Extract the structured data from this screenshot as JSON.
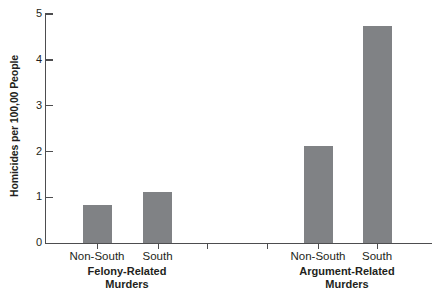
{
  "chart_data": {
    "type": "bar",
    "title": "",
    "xlabel": "",
    "ylabel": "Homicides per 100,00 People",
    "ylim": [
      0,
      5
    ],
    "yticks": [
      "0",
      "1",
      "2",
      "3",
      "4",
      "5"
    ],
    "grid": false,
    "legend": "none",
    "bar_color": "#808285",
    "axis_color": "#4d4d4f",
    "groups": [
      {
        "name": "Felony-Related Murders",
        "label_line1": "Felony-Related",
        "label_line2": "Murders",
        "categories": [
          "Non-South",
          "South"
        ],
        "values": [
          0.83,
          1.11
        ]
      },
      {
        "name": "Argument-Related Murders",
        "label_line1": "Argument-Related",
        "label_line2": "Murders",
        "categories": [
          "Non-South",
          "South"
        ],
        "values": [
          2.12,
          4.73
        ]
      }
    ],
    "categories": [
      "Non-South",
      "South",
      "Non-South",
      "South"
    ],
    "values": [
      0.83,
      1.11,
      2.12,
      4.73
    ]
  },
  "axis": {
    "y_title": "Homicides per 100,00 People",
    "ticks": [
      {
        "label": "5",
        "value": 5
      },
      {
        "label": "4",
        "value": 4
      },
      {
        "label": "3",
        "value": 3
      },
      {
        "label": "2",
        "value": 2
      },
      {
        "label": "1",
        "value": 1
      },
      {
        "label": "0",
        "value": 0
      }
    ]
  },
  "bars": [
    {
      "label": "Non-South",
      "group": "felony",
      "value": 0.83
    },
    {
      "label": "South",
      "group": "felony",
      "value": 1.11
    },
    {
      "label": "Non-South",
      "group": "argument",
      "value": 2.12
    },
    {
      "label": "South",
      "group": "argument",
      "value": 4.73
    }
  ],
  "group_labels": [
    {
      "line1": "Felony-Related",
      "line2": "Murders"
    },
    {
      "line1": "Argument-Related",
      "line2": "Murders"
    }
  ]
}
